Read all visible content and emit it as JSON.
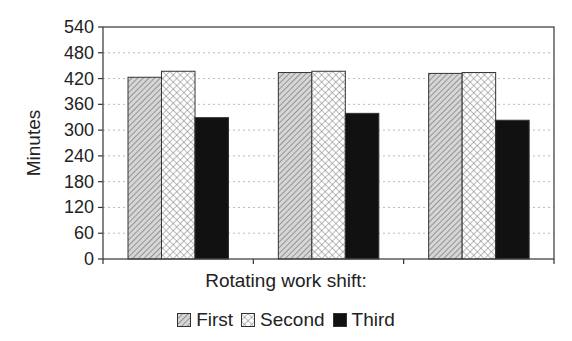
{
  "chart_data": {
    "type": "bar",
    "title": "",
    "xlabel": "Rotating work shift:",
    "ylabel": "Minutes",
    "ylim": [
      0,
      540
    ],
    "yticks": [
      0,
      60,
      120,
      180,
      240,
      300,
      360,
      420,
      480,
      540
    ],
    "grid": "horizontal dotted",
    "legend_position": "bottom",
    "categories": [
      "",
      "",
      ""
    ],
    "series": [
      {
        "name": "First",
        "pattern": "diagonal-hatch",
        "values": [
          423,
          434,
          432
        ]
      },
      {
        "name": "Second",
        "pattern": "crosshatch",
        "values": [
          437,
          437,
          434
        ]
      },
      {
        "name": "Third",
        "pattern": "solid-black",
        "values": [
          329,
          339,
          323
        ]
      }
    ]
  },
  "labels": {
    "xtitle": "Rotating work shift:",
    "ytitle": "Minutes",
    "legend": [
      "First",
      "Second",
      "Third"
    ]
  }
}
